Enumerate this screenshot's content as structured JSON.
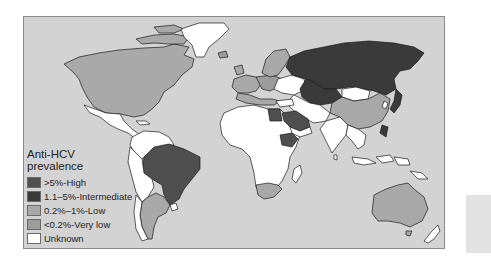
{
  "legend": {
    "title_line1": "Anti-HCV",
    "title_line2": "prevalence",
    "items": [
      {
        "label": ">5%-High",
        "color": "#4f4f4f"
      },
      {
        "label": "1.1–5%-Intermediate",
        "color": "#3a3a3a"
      },
      {
        "label": "0.2%–1%-Low",
        "color": "#a8a8a8"
      },
      {
        "label": "<0.2%-Very low",
        "color": "#9c9c9c"
      },
      {
        "label": "Unknown",
        "color": "#ffffff"
      }
    ]
  },
  "map": {
    "ocean_color": "#d3d3d3",
    "regions": [
      {
        "name": "North America (USA/Canada)",
        "category": "<0.2%-Very low"
      },
      {
        "name": "Greenland",
        "category": "Unknown"
      },
      {
        "name": "Mexico",
        "category": "Unknown"
      },
      {
        "name": "Brazil",
        "category": ">5%-High"
      },
      {
        "name": "Argentina",
        "category": "0.2%–1%-Low"
      },
      {
        "name": "Russia",
        "category": "1.1–5%-Intermediate"
      },
      {
        "name": "Kazakhstan",
        "category": "1.1–5%-Intermediate"
      },
      {
        "name": "Mongolia",
        "category": "Unknown"
      },
      {
        "name": "China",
        "category": "0.2%–1%-Low"
      },
      {
        "name": "Japan",
        "category": "1.1–5%-Intermediate"
      },
      {
        "name": "Egypt",
        "category": ">5%-High"
      },
      {
        "name": "Saudi Arabia",
        "category": ">5%-High"
      },
      {
        "name": "Ethiopia",
        "category": ">5%-High"
      },
      {
        "name": "South Africa",
        "category": "0.2%–1%-Low"
      },
      {
        "name": "Australia",
        "category": "0.2%–1%-Low"
      },
      {
        "name": "Scandinavia",
        "category": "0.2%–1%-Low"
      },
      {
        "name": "India",
        "category": "Unknown"
      },
      {
        "name": "Africa (most)",
        "category": "Unknown"
      }
    ]
  }
}
